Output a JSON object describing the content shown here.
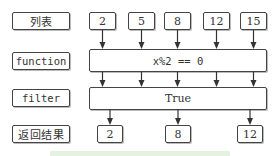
{
  "diagram": {
    "row_labels": {
      "list": "列表",
      "function": "function",
      "filter": "filter",
      "result": "返回结果"
    },
    "input_values": [
      "2",
      "5",
      "8",
      "12",
      "15"
    ],
    "function_expression": "x%2 == 0",
    "filter_value": "True",
    "result_values": [
      "2",
      "8",
      "12"
    ],
    "colors": {
      "border": "#444444",
      "text": "#333333",
      "bottom_band": "#e3f3e0"
    }
  }
}
